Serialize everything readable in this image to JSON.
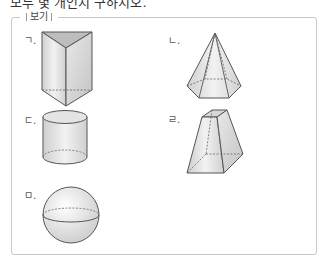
{
  "top_text": "모두 몇 개인지 구하시오.",
  "box": {
    "label": "보기"
  },
  "items": [
    {
      "marker": "ㄱ.",
      "shape": "triangular-prism"
    },
    {
      "marker": "ㄴ.",
      "shape": "hexagonal-pyramid"
    },
    {
      "marker": "ㄷ.",
      "shape": "cylinder"
    },
    {
      "marker": "ㄹ.",
      "shape": "square-frustum"
    },
    {
      "marker": "ㅁ.",
      "shape": "sphere"
    }
  ]
}
